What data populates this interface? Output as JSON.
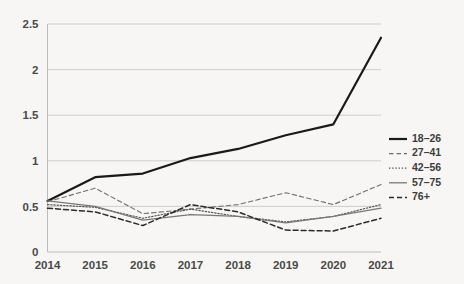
{
  "chart_data": {
    "type": "line",
    "title": "",
    "subtitle": "",
    "xlabel": "",
    "ylabel": "",
    "categories": [
      "2014",
      "2015",
      "2016",
      "2017",
      "2018",
      "2019",
      "2020",
      "2021"
    ],
    "x": [
      2014,
      2015,
      2016,
      2017,
      2018,
      2019,
      2020,
      2021
    ],
    "xlim": [
      2014,
      2021
    ],
    "ylim": [
      0,
      2.5
    ],
    "yticks": [
      "0",
      "0.5",
      "1",
      "1.5",
      "2",
      "2.5"
    ],
    "ytick_values": [
      0,
      0.5,
      1,
      1.5,
      2,
      2.5
    ],
    "grid": true,
    "legend_position": "right",
    "series": [
      {
        "name": "18–26",
        "style": "solid",
        "width": 2.2,
        "color": "#1a1a1a",
        "values": [
          0.56,
          0.82,
          0.86,
          1.03,
          1.13,
          1.28,
          1.4,
          2.35
        ]
      },
      {
        "name": "27–41",
        "style": "dashed",
        "width": 1.1,
        "color": "#6f6f6d",
        "values": [
          0.55,
          0.7,
          0.42,
          0.47,
          0.52,
          0.65,
          0.52,
          0.74
        ]
      },
      {
        "name": "42–56",
        "style": "dotted",
        "width": 1.2,
        "color": "#57575a",
        "values": [
          0.52,
          0.49,
          0.37,
          0.47,
          0.39,
          0.33,
          0.39,
          0.52
        ]
      },
      {
        "name": "57–75",
        "style": "solid",
        "width": 1.3,
        "color": "#787876",
        "values": [
          0.56,
          0.5,
          0.35,
          0.41,
          0.39,
          0.32,
          0.39,
          0.48
        ]
      },
      {
        "name": "76+",
        "style": "dashed",
        "width": 1.5,
        "color": "#2b2b2b",
        "values": [
          0.48,
          0.44,
          0.29,
          0.52,
          0.44,
          0.24,
          0.23,
          0.37
        ]
      }
    ]
  },
  "legend": {
    "items": [
      {
        "label": "18–26"
      },
      {
        "label": "27–41"
      },
      {
        "label": "42–56"
      },
      {
        "label": "57–75"
      },
      {
        "label": "76+"
      }
    ]
  },
  "colors": {
    "background": "#f7f6f4",
    "gridline": "#c9c9c6",
    "text": "#4a4a48"
  }
}
